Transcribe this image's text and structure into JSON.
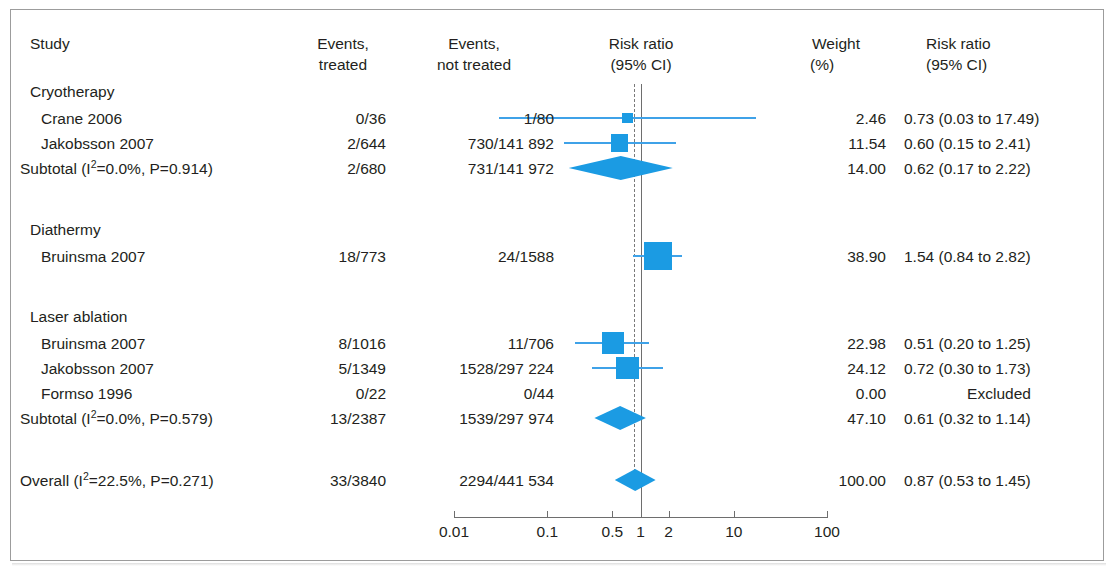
{
  "figure": {
    "type": "forest-plot",
    "accent_color": "#1b9be3",
    "ci_color": "#3fa2e8",
    "null_line_color": "#6e6e6e"
  },
  "headers": {
    "study": "Study",
    "events_treated_l1": "Events,",
    "events_treated_l2": "treated",
    "events_not_treated_l1": "Events,",
    "events_not_treated_l2": "not treated",
    "plot_l1": "Risk ratio",
    "plot_l2": "(95% CI)",
    "weight_l1": "Weight",
    "weight_l2": "(%)",
    "rr_l1": "Risk ratio",
    "rr_l2": "(95% CI)"
  },
  "groups": [
    {
      "name": "Cryotherapy",
      "rows": [
        {
          "label": "Crane 2006",
          "treated": "0/36",
          "not_treated": "1/80",
          "weight": "2.46",
          "rr": "0.73 (0.03 to 17.49)",
          "est": 0.73,
          "lo": 0.03,
          "hi": 17.49,
          "w": 2.46
        },
        {
          "label": "Jakobsson 2007",
          "treated": "2/644",
          "not_treated": "730/141 892",
          "weight": "11.54",
          "rr": "0.60 (0.15 to 2.41)",
          "est": 0.6,
          "lo": 0.15,
          "hi": 2.41,
          "w": 11.54
        }
      ],
      "subtotal": {
        "label_pre": "Subtotal (I",
        "label_sup": "2",
        "label_post": "=0.0%, P=0.914)",
        "treated": "2/680",
        "not_treated": "731/141 972",
        "weight": "14.00",
        "rr": "0.62 (0.17 to 2.22)",
        "est": 0.62,
        "lo": 0.17,
        "hi": 2.22
      }
    },
    {
      "name": "Diathermy",
      "rows": [
        {
          "label": "Bruinsma 2007",
          "treated": "18/773",
          "not_treated": "24/1588",
          "weight": "38.90",
          "rr": "1.54 (0.84 to 2.82)",
          "est": 1.54,
          "lo": 0.84,
          "hi": 2.82,
          "w": 38.9
        }
      ],
      "subtotal": null
    },
    {
      "name": "Laser ablation",
      "rows": [
        {
          "label": "Bruinsma 2007",
          "treated": "8/1016",
          "not_treated": "11/706",
          "weight": "22.98",
          "rr": "0.51 (0.20 to 1.25)",
          "est": 0.51,
          "lo": 0.2,
          "hi": 1.25,
          "w": 22.98
        },
        {
          "label": "Jakobsson 2007",
          "treated": "5/1349",
          "not_treated": "1528/297 224",
          "weight": "24.12",
          "rr": "0.72 (0.30 to 1.73)",
          "est": 0.72,
          "lo": 0.3,
          "hi": 1.73,
          "w": 24.12
        },
        {
          "label": "Formso 1996",
          "treated": "0/22",
          "not_treated": "0/44",
          "weight": "0.00",
          "rr": "Excluded",
          "est": null,
          "lo": null,
          "hi": null,
          "w": 0
        }
      ],
      "subtotal": {
        "label_pre": "Subtotal (I",
        "label_sup": "2",
        "label_post": "=0.0%, P=0.579)",
        "treated": "13/2387",
        "not_treated": "1539/297 974",
        "weight": "47.10",
        "rr": "0.61 (0.32 to 1.14)",
        "est": 0.61,
        "lo": 0.32,
        "hi": 1.14
      }
    }
  ],
  "overall": {
    "label_pre": "Overall (I",
    "label_sup": "2",
    "label_post": "=22.5%, P=0.271)",
    "treated": "33/3840",
    "not_treated": "2294/441 534",
    "weight": "100.00",
    "rr": "0.87 (0.53 to 1.45)",
    "est": 0.87,
    "lo": 0.53,
    "hi": 1.45
  },
  "axis": {
    "ticks": [
      "0.01",
      "0.1",
      "0.5",
      "1",
      "2",
      "10",
      "100"
    ],
    "tick_values": [
      0.01,
      0.1,
      0.5,
      1,
      2,
      10,
      100
    ],
    "min": 0.01,
    "max": 100,
    "scale": "log"
  },
  "chart_data": {
    "type": "forest",
    "title": "",
    "xlabel": "Risk ratio (95% CI)",
    "ylabel": "",
    "xscale": "log",
    "xlim": [
      0.01,
      100
    ],
    "null_value": 1,
    "overall_reference": 0.87,
    "xticks": [
      0.01,
      0.1,
      0.5,
      1,
      2,
      10,
      100
    ],
    "xticklabels": [
      "0.01",
      "0.1",
      "0.5",
      "1",
      "2",
      "10",
      "100"
    ],
    "studies": [
      {
        "group": "Cryotherapy",
        "label": "Crane 2006",
        "events_treated": "0/36",
        "events_not_treated": "1/80",
        "weight": 2.46,
        "rr": 0.73,
        "ci_low": 0.03,
        "ci_high": 17.49
      },
      {
        "group": "Cryotherapy",
        "label": "Jakobsson 2007",
        "events_treated": "2/644",
        "events_not_treated": "730/141 892",
        "weight": 11.54,
        "rr": 0.6,
        "ci_low": 0.15,
        "ci_high": 2.41
      },
      {
        "group": "Cryotherapy",
        "label": "Subtotal",
        "events_treated": "2/680",
        "events_not_treated": "731/141 972",
        "weight": 14.0,
        "rr": 0.62,
        "ci_low": 0.17,
        "ci_high": 2.22,
        "is_summary": true,
        "i_squared": "0.0%",
        "p": 0.914
      },
      {
        "group": "Diathermy",
        "label": "Bruinsma 2007",
        "events_treated": "18/773",
        "events_not_treated": "24/1588",
        "weight": 38.9,
        "rr": 1.54,
        "ci_low": 0.84,
        "ci_high": 2.82
      },
      {
        "group": "Laser ablation",
        "label": "Bruinsma 2007",
        "events_treated": "8/1016",
        "events_not_treated": "11/706",
        "weight": 22.98,
        "rr": 0.51,
        "ci_low": 0.2,
        "ci_high": 1.25
      },
      {
        "group": "Laser ablation",
        "label": "Jakobsson 2007",
        "events_treated": "5/1349",
        "events_not_treated": "1528/297 224",
        "weight": 24.12,
        "rr": 0.72,
        "ci_low": 0.3,
        "ci_high": 1.73
      },
      {
        "group": "Laser ablation",
        "label": "Formso 1996",
        "events_treated": "0/22",
        "events_not_treated": "0/44",
        "weight": 0.0,
        "rr": null,
        "ci_low": null,
        "ci_high": null,
        "note": "Excluded"
      },
      {
        "group": "Laser ablation",
        "label": "Subtotal",
        "events_treated": "13/2387",
        "events_not_treated": "1539/297 974",
        "weight": 47.1,
        "rr": 0.61,
        "ci_low": 0.32,
        "ci_high": 1.14,
        "is_summary": true,
        "i_squared": "0.0%",
        "p": 0.579
      },
      {
        "group": "",
        "label": "Overall",
        "events_treated": "33/3840",
        "events_not_treated": "2294/441 534",
        "weight": 100.0,
        "rr": 0.87,
        "ci_low": 0.53,
        "ci_high": 1.45,
        "is_summary": true,
        "i_squared": "22.5%",
        "p": 0.271
      }
    ]
  }
}
